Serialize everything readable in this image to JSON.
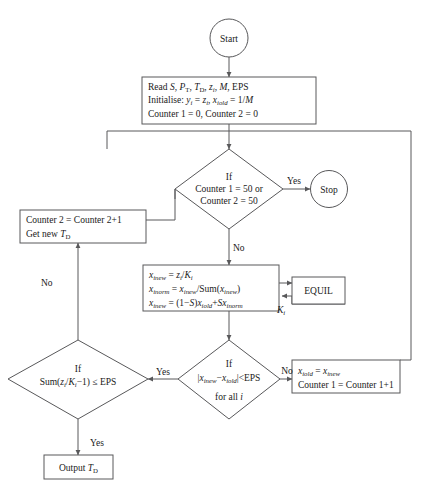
{
  "diagram": {
    "colors": {
      "stroke": "#58585a",
      "text": "#1a1a1a",
      "background": "#ffffff"
    }
  },
  "nodes": {
    "start": {
      "label": "Start",
      "shape": "terminator-circle"
    },
    "stop": {
      "label": "Stop",
      "shape": "terminator-circle"
    },
    "read_init": {
      "shape": "process-box",
      "line1_pre": "Read ",
      "line1_S": "S",
      "line1_c1": ", ",
      "line1_PT": "P",
      "line1_PT_sub": "T",
      "line1_c2": ", ",
      "line1_TD": "T",
      "line1_TD_sub": "D",
      "line1_c3": ", ",
      "line1_z": "z",
      "line1_z_sub": "i",
      "line1_c4": ", ",
      "line1_M": "M",
      "line1_c5": ", EPS",
      "line2_pre": "Initialise: ",
      "line2_y": "y",
      "line2_y_sub": "i",
      "line2_eq1": " = ",
      "line2_z": "z",
      "line2_z_sub": "i",
      "line2_c1": ", ",
      "line2_x": "x",
      "line2_x_sub": "iold",
      "line2_eq2": " = 1/",
      "line2_M": "M",
      "line3": "Counter 1 = 0, Counter 2 = 0"
    },
    "counter_check": {
      "shape": "decision-diamond",
      "line1": "If",
      "line2": "Counter 1 = 50 or",
      "line3": "Counter 2 = 50"
    },
    "counter2_update": {
      "shape": "process-box",
      "line1": "Counter 2 = Counter 2+1",
      "line2_pre": "Get new ",
      "line2_T": "T",
      "line2_T_sub": "D"
    },
    "equations": {
      "shape": "process-box",
      "eq1_x": "x",
      "eq1_x_sub": "inew",
      "eq1_mid": " = ",
      "eq1_z": "z",
      "eq1_z_sub": "i",
      "eq1_slash": "/",
      "eq1_K": "K",
      "eq1_K_sub": "i",
      "eq2_x": "x",
      "eq2_x_sub": "inorm",
      "eq2_mid": " = ",
      "eq2_x2": "x",
      "eq2_x2_sub": "inew",
      "eq2_sum": "/Sum(",
      "eq2_x3": "x",
      "eq2_x3_sub": "inew",
      "eq2_close": ")",
      "eq3_x": "x",
      "eq3_x_sub": "inew",
      "eq3_mid": " = (1−",
      "eq3_S": "S",
      "eq3_close": ")",
      "eq3_x2": "x",
      "eq3_x2_sub": "iold",
      "eq3_plus": "+",
      "eq3_S2": "S",
      "eq3_x3": "x",
      "eq3_x3_sub": "inorm"
    },
    "equil": {
      "label": "EQUIL",
      "shape": "process-box"
    },
    "equil_k_label": {
      "K": "K",
      "K_sub": "i"
    },
    "converge_check": {
      "shape": "decision-diamond",
      "line1": "If",
      "line2_bar1": "|",
      "line2_x1": "x",
      "line2_x1_sub": "inew",
      "line2_minus": "−",
      "line2_x2": "x",
      "line2_x2_sub": "iold",
      "line2_bar2": "|<EPS",
      "line3_pre": "for all ",
      "line3_i": "i"
    },
    "sum_check": {
      "shape": "decision-diamond",
      "line1": "If",
      "line2_pre": "Sum(",
      "line2_z": "z",
      "line2_z_sub": "i",
      "line2_slash": "/",
      "line2_K": "K",
      "line2_K_sub": "i",
      "line2_post": "−1) ≤ EPS"
    },
    "counter1_update": {
      "shape": "process-box",
      "line1_x1": "x",
      "line1_x1_sub": "iold",
      "line1_eq": " = ",
      "line1_x2": "x",
      "line1_x2_sub": "inew",
      "line2": "Counter 1 = Counter 1+1"
    },
    "output": {
      "shape": "process-box",
      "pre": "Output ",
      "T": "T",
      "T_sub": "D"
    }
  },
  "edge_labels": {
    "counter_yes": "Yes",
    "counter_no": "No",
    "converge_yes": "Yes",
    "converge_no": "No",
    "sum_no": "No",
    "sum_yes": "Yes"
  }
}
